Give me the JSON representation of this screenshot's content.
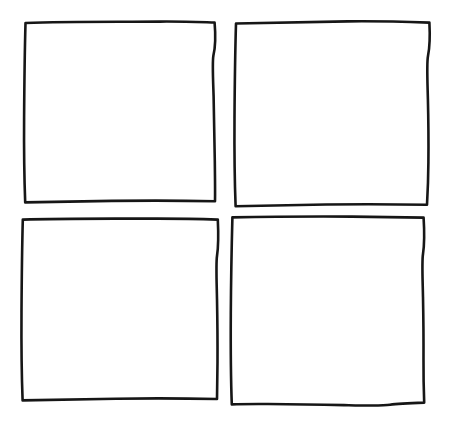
{
  "canvas": {
    "width": 450,
    "height": 421,
    "background_color": "#ffffff",
    "stroke_color": "#161616",
    "stroke_width": 2.6,
    "style": "hand-drawn-ink-sketch",
    "description": "Hand-drawn 2x2 grid of four empty squares"
  },
  "grid": {
    "rows": 2,
    "columns": 2,
    "cell_count": 4,
    "cells": [
      {
        "id": "cell-top-left",
        "row": 1,
        "column": 1,
        "label": "",
        "fill_color": "#ffffff",
        "path": "M 25.5 23.0 C 70 21.2, 120 22.0, 160 21.6 C 185 21.4, 203 22.2, 214.6 22.5 C 215.9 38, 215.2 48, 213.4 55.5 C 212.2 62, 213.0 78, 213.6 96 C 214.2 118, 214.4 140, 214.8 161 C 215.0 176, 215.2 192, 215.0 201.2 C 186 200.6, 150 200.4, 112 200.9 C 80 201.3, 48 201.9, 25.2 202.4 C 24.2 176, 23.9 148, 24.1 118 C 24.3 88, 24.6 56, 25.5 23.0 Z"
      },
      {
        "id": "cell-top-right",
        "row": 1,
        "column": 2,
        "label": "",
        "fill_color": "#ffffff",
        "path": "M 236.0 23.5 C 272 22.6, 310 21.9, 348 21.4 C 378 21.0, 405 21.8, 429.4 22.6 C 430.2 38, 429.6 48, 428.0 56.0 C 426.6 63, 427.4 80, 427.9 99 C 428.4 120, 428.6 142, 428.4 162 C 428.3 178, 427.6 194, 427.0 204.8 C 398 204.2, 362 204.0, 326 204.5 C 292 205.0, 258 205.6, 235.6 206.2 C 234.6 180, 234.3 150, 234.5 118 C 234.7 88, 235.1 54, 236.0 23.5 Z"
      },
      {
        "id": "cell-bottom-left",
        "row": 2,
        "column": 1,
        "label": "",
        "fill_color": "#ffffff",
        "path": "M 22.8 219.6 C 62 218.4, 108 218.8, 150 218.6 C 180 218.5, 204 219.1, 217.8 219.6 C 218.6 236, 218.2 248, 217.0 256.0 C 215.9 263, 216.6 280, 217.0 299 C 217.4 320, 217.6 342, 217.5 362 C 217.4 378, 217.2 392, 217.0 399.0 C 188 398.4, 152 398.2, 116 398.7 C 82 399.2, 48 399.8, 22.6 400.4 C 21.6 374, 21.3 344, 21.5 312 C 21.7 280, 22.0 250, 22.8 219.6 Z"
      },
      {
        "id": "cell-bottom-right",
        "row": 2,
        "column": 2,
        "label": "",
        "fill_color": "#ffffff",
        "path": "M 232.4 217.4 C 272 216.6, 314 216.4, 352 216.6 C 382 216.8, 408 217.2, 423.6 217.6 C 424.6 234, 424.2 246, 423.0 254.0 C 421.8 261, 422.6 278, 423.0 297 C 423.4 318, 423.6 340, 423.5 360 C 423.4 376, 423.8 392, 424.2 402.6 C 410 403.0, 398 403.4, 390 404.8 C 382 406.2, 364 405.6, 344 405.1 C 318 404.5, 290 404.2, 268 404.0 C 250 403.9, 238 404.1, 231.8 404.4 C 230.8 378, 230.6 348, 230.8 314 C 231.0 282, 231.6 248, 232.4 217.4 Z"
      }
    ]
  }
}
